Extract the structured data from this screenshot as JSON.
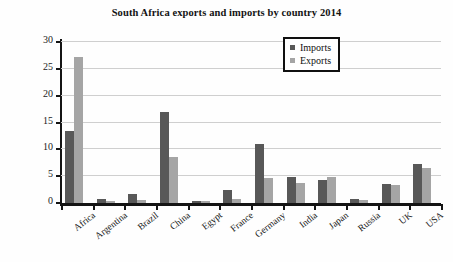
{
  "chart_data": {
    "type": "bar",
    "title": "South Africa exports and imports by country 2014",
    "xlabel": "",
    "ylabel": "Billions of dollars",
    "ylim": [
      0,
      30
    ],
    "ytick_step": 5,
    "yticks": [
      0,
      5,
      10,
      15,
      20,
      25,
      30
    ],
    "grid": true,
    "legend_position": "top-right",
    "categories": [
      "Africa",
      "Argentina",
      "Brazil",
      "China",
      "Egypt",
      "France",
      "Germany",
      "India",
      "Japan",
      "Russia",
      "UK",
      "USA"
    ],
    "series": [
      {
        "name": "Imports",
        "color": "#585858",
        "values": [
          13.5,
          0.75,
          1.6,
          17.0,
          0.3,
          2.4,
          11.0,
          4.9,
          4.2,
          0.7,
          3.6,
          7.2
        ]
      },
      {
        "name": "Exports",
        "color": "#a5a5a5",
        "values": [
          27.3,
          0.45,
          0.55,
          8.6,
          0.35,
          0.8,
          4.6,
          3.7,
          4.9,
          0.6,
          3.4,
          6.5
        ]
      }
    ]
  },
  "legend": {
    "items": [
      {
        "label": "Imports",
        "color": "#585858"
      },
      {
        "label": "Exports",
        "color": "#a5a5a5"
      }
    ]
  }
}
